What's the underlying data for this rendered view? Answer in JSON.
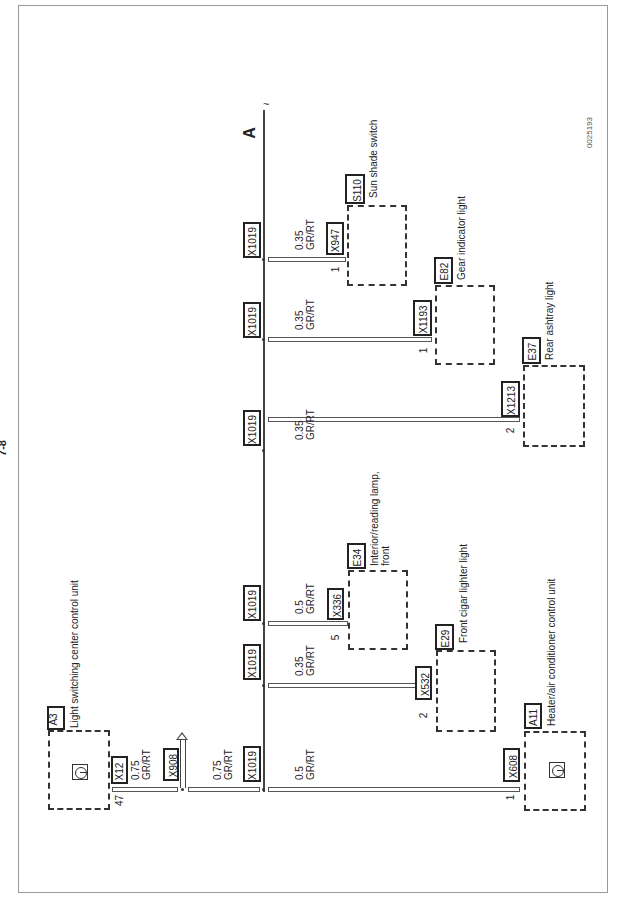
{
  "page": {
    "number": "7-8",
    "drawing_id": "0025193",
    "continuation_label": "A"
  },
  "source": {
    "component": "A3",
    "label": "Light switching center control unit",
    "connector": "X12",
    "pin": "47",
    "wire": {
      "size": "0.75",
      "color": "GR/RT"
    },
    "ground_connector": "X908"
  },
  "bus": {
    "segment_wire": {
      "size": "0.75",
      "color": "GR/RT"
    },
    "splice": "X1019"
  },
  "branches": [
    {
      "splice": "X1019",
      "wire_size": "0.5",
      "wire_color": "GR/RT",
      "connector": "X608",
      "pin": "1",
      "component": "A11",
      "label": "Heater/air conditioner control unit"
    },
    {
      "splice": "X1019",
      "wire_size": "0.35",
      "wire_color": "GR/RT",
      "connector": "X532",
      "pin": "2",
      "component": "E29",
      "label": "Front cigar lighter light"
    },
    {
      "splice": "X1019",
      "wire_size": "0.5",
      "wire_color": "GR/RT",
      "connector": "X336",
      "pin": "5",
      "component": "E34",
      "label": "Interior/reading lamp,",
      "label2": "front"
    },
    {
      "splice": "X1019",
      "wire_size": "0.35",
      "wire_color": "GR/RT",
      "connector": "X1213",
      "pin": "2",
      "component": "E37",
      "label": "Rear ashtray light"
    },
    {
      "splice": "X1019",
      "wire_size": "0.35",
      "wire_color": "GR/RT",
      "connector": "X1193",
      "pin": "1",
      "component": "E82",
      "label": "Gear indicator light"
    },
    {
      "splice": "X1019",
      "wire_size": "0.35",
      "wire_color": "GR/RT",
      "connector": "X947",
      "pin": "1",
      "component": "S110",
      "label": "Sun shade switch"
    }
  ],
  "icons": {
    "control_unit": "control-unit-symbol-icon"
  }
}
